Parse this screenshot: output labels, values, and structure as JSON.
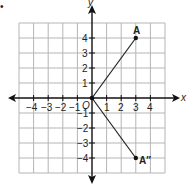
{
  "diagram": {
    "axes": {
      "x_label": "x",
      "y_label": "y",
      "x_ticks": [
        "−4",
        "−3",
        "−2",
        "−1",
        "1",
        "2",
        "3",
        "4"
      ],
      "y_ticks": [
        "4",
        "3",
        "2",
        "1",
        "−1",
        "−2",
        "−3",
        "−4"
      ],
      "origin_label": "O"
    },
    "points": [
      {
        "label": "A",
        "x": 3,
        "y": 4
      },
      {
        "label": "A″",
        "x": 3,
        "y": -4
      },
      {
        "label": "O",
        "x": 0,
        "y": 0
      }
    ],
    "segments": [
      {
        "from": "O",
        "to": "A"
      },
      {
        "from": "O",
        "to": "A″"
      }
    ],
    "bullet": "•"
  }
}
